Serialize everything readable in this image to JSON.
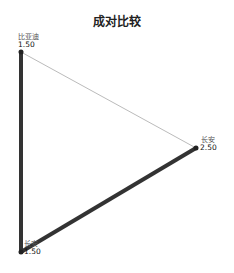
{
  "title": "成对比较",
  "nodes": [
    {
      "name": "比亚迪",
      "value": "1.50",
      "x": 21,
      "y": 52
    },
    {
      "name": "长安",
      "value": "2.50",
      "x": 196,
      "y": 148
    },
    {
      "name": "长安",
      "value": "1.50",
      "x": 21,
      "y": 252
    }
  ],
  "edges": [
    {
      "from": 0,
      "to": 2,
      "weight": "thick",
      "color": "#333333"
    },
    {
      "from": 2,
      "to": 1,
      "weight": "thick",
      "color": "#333333"
    },
    {
      "from": 0,
      "to": 1,
      "weight": "thin",
      "color": "#bbbbbb"
    }
  ]
}
